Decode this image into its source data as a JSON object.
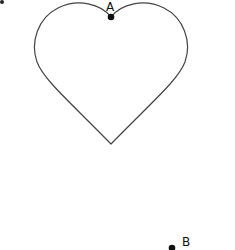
{
  "diagram": {
    "shape": "heart",
    "stroke_color": "#444444",
    "points": [
      {
        "label": "A",
        "x": 111,
        "y": 18
      },
      {
        "label": "B",
        "x": 172,
        "y": 247
      }
    ]
  }
}
